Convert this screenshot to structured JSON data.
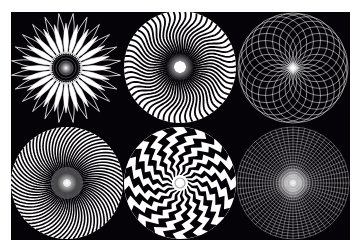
{
  "image": {
    "description": "Six white geometric radial / spiral op-art patterns on a black background, arranged in two rows of three",
    "background_color": "#050308",
    "foreground_color": "#ffffff",
    "border_color": "#ffffff"
  },
  "patterns": [
    {
      "name": "flower-petal-rosette",
      "row": 1,
      "col": 1,
      "cx": 66,
      "cy": 68,
      "r": 56,
      "petals": 24
    },
    {
      "name": "wavy-radial-spiral",
      "row": 1,
      "col": 2,
      "cx": 180,
      "cy": 67,
      "r": 56,
      "rays": 60
    },
    {
      "name": "interlaced-circle-lattice",
      "row": 1,
      "col": 3,
      "cx": 293,
      "cy": 68,
      "r": 55,
      "rings": 24
    },
    {
      "name": "twisted-ray-disc",
      "row": 2,
      "col": 1,
      "cx": 67,
      "cy": 183,
      "r": 56,
      "rays": 72
    },
    {
      "name": "zigzag-checker-spiral",
      "row": 2,
      "col": 2,
      "cx": 180,
      "cy": 183,
      "r": 56,
      "arms": 16
    },
    {
      "name": "dotted-radial-grid",
      "row": 2,
      "col": 3,
      "cx": 293,
      "cy": 183,
      "r": 56,
      "rings": 20,
      "rays": 60
    }
  ]
}
